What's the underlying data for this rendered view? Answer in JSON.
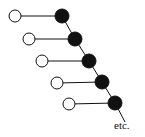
{
  "diagram": {
    "label": "etc.",
    "rows": [
      {
        "open": [
          15,
          16
        ],
        "filled": [
          62,
          16
        ]
      },
      {
        "open": [
          29,
          39
        ],
        "filled": [
          75,
          39
        ]
      },
      {
        "open": [
          42,
          61
        ],
        "filled": [
          89,
          61
        ]
      },
      {
        "open": [
          57,
          83
        ],
        "filled": [
          102,
          82
        ]
      },
      {
        "open": [
          69,
          104
        ],
        "filled": [
          115,
          103
        ]
      }
    ],
    "tail_end": [
      125,
      122
    ],
    "colors": {
      "stroke": "#111111",
      "filled": "#111111",
      "open": "#ffffff"
    }
  }
}
